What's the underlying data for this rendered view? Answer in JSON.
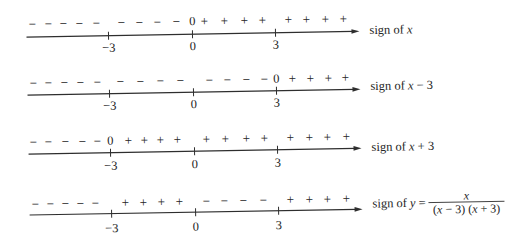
{
  "axis": {
    "x_start": 28,
    "x_end": 361,
    "ticks": [
      {
        "value": -3,
        "label": "−3",
        "x": 110
      },
      {
        "value": 0,
        "label": "0",
        "x": 194
      },
      {
        "value": 3,
        "label": "3",
        "x": 277
      }
    ]
  },
  "rows": [
    {
      "id": "x",
      "label": {
        "prefix": "sign of ",
        "var": "x",
        "suffix": ""
      },
      "intervals": {
        "(-inf,-3)": "−",
        "(-3,0)": "−",
        "at 0": "0",
        "(0,3)": "+",
        "(3,inf)": "+"
      },
      "line_y": 33,
      "sign_y": 20,
      "tick_label_y": 45,
      "label_x": 371,
      "label_baseline": 36,
      "signs": [
        {
          "s": "−",
          "x": 34
        },
        {
          "s": "−",
          "x": 50
        },
        {
          "s": "−",
          "x": 65
        },
        {
          "s": "−",
          "x": 81
        },
        {
          "s": "−",
          "x": 98
        },
        {
          "s": "−",
          "x": 123
        },
        {
          "s": "−",
          "x": 141
        },
        {
          "s": "−",
          "x": 159
        },
        {
          "s": "−",
          "x": 178
        },
        {
          "s": "0",
          "x": 194
        },
        {
          "s": "+",
          "x": 206
        },
        {
          "s": "+",
          "x": 226
        },
        {
          "s": "+",
          "x": 246
        },
        {
          "s": "+",
          "x": 264
        },
        {
          "s": "+",
          "x": 290
        },
        {
          "s": "+",
          "x": 308
        },
        {
          "s": "+",
          "x": 327
        },
        {
          "s": "+",
          "x": 345
        }
      ]
    },
    {
      "id": "x-minus-3",
      "label": {
        "prefix": "sign of ",
        "var": "x",
        "suffix": " − 3"
      },
      "intervals": {
        "(-inf,-3)": "−",
        "(-3,0)": "−",
        "(0,3)": "−",
        "at 3": "0",
        "(3,inf)": "+"
      },
      "line_y": 91,
      "sign_y": 79,
      "tick_label_y": 103,
      "label_x": 371,
      "label_baseline": 92,
      "signs": [
        {
          "s": "−",
          "x": 34
        },
        {
          "s": "−",
          "x": 49
        },
        {
          "s": "−",
          "x": 65
        },
        {
          "s": "−",
          "x": 81
        },
        {
          "s": "−",
          "x": 98
        },
        {
          "s": "−",
          "x": 121
        },
        {
          "s": "−",
          "x": 141
        },
        {
          "s": "−",
          "x": 161
        },
        {
          "s": "−",
          "x": 181
        },
        {
          "s": "−",
          "x": 210
        },
        {
          "s": "−",
          "x": 228
        },
        {
          "s": "−",
          "x": 247
        },
        {
          "s": "−",
          "x": 265
        },
        {
          "s": "0",
          "x": 277
        },
        {
          "s": "+",
          "x": 293
        },
        {
          "s": "+",
          "x": 311
        },
        {
          "s": "+",
          "x": 329
        },
        {
          "s": "+",
          "x": 346
        }
      ]
    },
    {
      "id": "x-plus-3",
      "label": {
        "prefix": "sign of ",
        "var": "x",
        "suffix": " + 3"
      },
      "intervals": {
        "(-inf,-3)": "−",
        "at -3": "0",
        "(-3,0)": "+",
        "(0,3)": "+",
        "(3,inf)": "+"
      },
      "line_y": 150,
      "sign_y": 138,
      "tick_label_y": 163,
      "label_x": 371,
      "label_baseline": 153,
      "signs": [
        {
          "s": "−",
          "x": 33
        },
        {
          "s": "−",
          "x": 48
        },
        {
          "s": "−",
          "x": 65
        },
        {
          "s": "−",
          "x": 82
        },
        {
          "s": "−",
          "x": 97
        },
        {
          "s": "0",
          "x": 110
        },
        {
          "s": "+",
          "x": 128
        },
        {
          "s": "+",
          "x": 144
        },
        {
          "s": "+",
          "x": 160
        },
        {
          "s": "+",
          "x": 177
        },
        {
          "s": "+",
          "x": 206
        },
        {
          "s": "+",
          "x": 225
        },
        {
          "s": "+",
          "x": 246
        },
        {
          "s": "+",
          "x": 264
        },
        {
          "s": "+",
          "x": 290
        },
        {
          "s": "+",
          "x": 309
        },
        {
          "s": "+",
          "x": 327
        },
        {
          "s": "+",
          "x": 346
        }
      ]
    },
    {
      "id": "y",
      "label": {
        "prefix": "sign of ",
        "var": "y",
        "suffix": " =",
        "fraction": {
          "numerator": "x",
          "denominator": [
            {
              "t": "(",
              "italic": false
            },
            {
              "t": "x",
              "italic": true
            },
            {
              "t": " − 3) (",
              "italic": false
            },
            {
              "t": "x",
              "italic": true
            },
            {
              "t": " + 3)",
              "italic": false
            }
          ],
          "bar_x1": 427,
          "bar_x2": 503,
          "bar_y": 205.5,
          "center_x": 465,
          "numerator_baseline": 203,
          "denominator_baseline": 216.5
        }
      },
      "intervals": {
        "(-inf,-3)": "−",
        "(-3,0)": "+",
        "(0,3)": "−",
        "(3,inf)": "+"
      },
      "line_y": 211,
      "sign_y": 200,
      "tick_label_y": 225.5,
      "label_x": 371,
      "label_baseline": 209.5,
      "signs": [
        {
          "s": "−",
          "x": 34
        },
        {
          "s": "−",
          "x": 49
        },
        {
          "s": "−",
          "x": 64
        },
        {
          "s": "−",
          "x": 79
        },
        {
          "s": "−",
          "x": 94
        },
        {
          "s": "+",
          "x": 124
        },
        {
          "s": "+",
          "x": 142
        },
        {
          "s": "+",
          "x": 160
        },
        {
          "s": "+",
          "x": 178
        },
        {
          "s": "−",
          "x": 205
        },
        {
          "s": "−",
          "x": 223
        },
        {
          "s": "−",
          "x": 242
        },
        {
          "s": "−",
          "x": 262
        },
        {
          "s": "+",
          "x": 289
        },
        {
          "s": "+",
          "x": 308
        },
        {
          "s": "+",
          "x": 326
        },
        {
          "s": "+",
          "x": 345
        }
      ]
    }
  ]
}
